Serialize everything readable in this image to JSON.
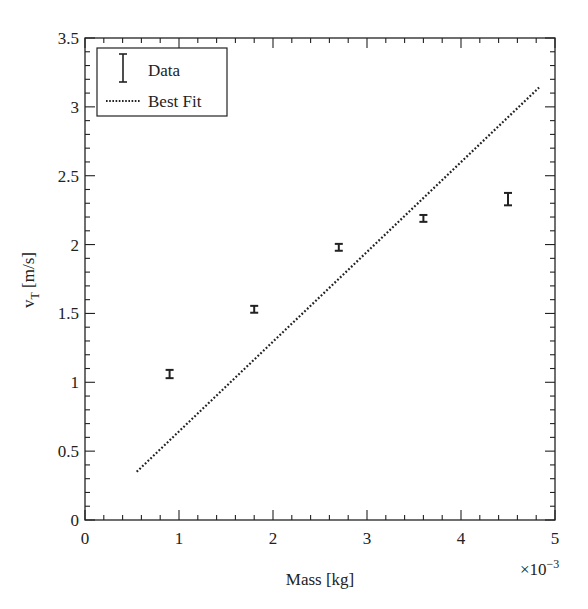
{
  "chart_data": {
    "type": "scatter",
    "title": "",
    "xlabel": "Mass [kg]",
    "ylabel": "v_T [m/s]",
    "ylabel_main": "v",
    "ylabel_sub": "T",
    "ylabel_rest": " [m/s]",
    "x_multiplier": "×10",
    "x_multiplier_exp": "−3",
    "xlim": [
      0,
      5
    ],
    "ylim": [
      0,
      3.5
    ],
    "x_ticks": [
      "0",
      "1",
      "2",
      "3",
      "4",
      "5"
    ],
    "y_ticks": [
      "0",
      "0.5",
      "1",
      "1.5",
      "2",
      "2.5",
      "3",
      "3.5"
    ],
    "grid": false,
    "legend_position": "upper left",
    "series": [
      {
        "name": "Data",
        "kind": "errorbar",
        "x": [
          0.9,
          1.8,
          2.7,
          3.6,
          4.5
        ],
        "y": [
          1.06,
          1.53,
          1.98,
          2.19,
          2.33
        ],
        "yerr": [
          0.03,
          0.025,
          0.025,
          0.025,
          0.045
        ]
      },
      {
        "name": "Best Fit",
        "kind": "line",
        "style": "dotted",
        "x": [
          0.55,
          4.83
        ],
        "y": [
          0.35,
          3.14
        ]
      }
    ]
  },
  "legend": {
    "items": [
      {
        "label": "Data",
        "icon": "errorbar-icon"
      },
      {
        "label": "Best Fit",
        "icon": "dotted-line-icon"
      }
    ]
  },
  "colors": {
    "ink": "#222222",
    "background": "#ffffff"
  }
}
